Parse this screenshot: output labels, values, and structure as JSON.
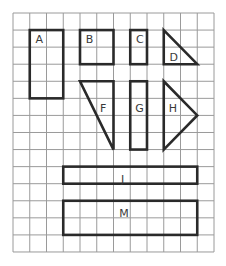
{
  "diagram": {
    "type": "grid-shapes",
    "grid": {
      "origin_x": 13,
      "origin_y": 13,
      "cell_w": 16.75,
      "cell_h": 17.07,
      "cols": 12,
      "rows": 14,
      "line_color": "#9a9a9a",
      "shape_color": "#2a2a2a"
    },
    "shapes": [
      {
        "label": "A",
        "kind": "rect",
        "col": 1,
        "row": 1,
        "w": 2,
        "h": 4,
        "label_pos": [
          0.35,
          0.55
        ]
      },
      {
        "label": "B",
        "kind": "rect",
        "col": 4,
        "row": 1,
        "w": 2,
        "h": 2,
        "label_pos": [
          0.35,
          0.55
        ]
      },
      {
        "label": "C",
        "kind": "rect",
        "col": 7,
        "row": 1,
        "w": 1,
        "h": 2,
        "label_pos": [
          0.35,
          0.55
        ]
      },
      {
        "label": "D",
        "kind": "triangle",
        "points": [
          [
            9,
            1
          ],
          [
            9,
            3
          ],
          [
            11,
            3
          ]
        ],
        "label_pos": [
          9.35,
          2.55
        ]
      },
      {
        "label": "F",
        "kind": "triangle",
        "points": [
          [
            4,
            4
          ],
          [
            6,
            4
          ],
          [
            6,
            8
          ]
        ],
        "label_pos": [
          5.2,
          5.55
        ]
      },
      {
        "label": "G",
        "kind": "rect",
        "col": 7,
        "row": 4,
        "w": 1,
        "h": 4,
        "label_pos": [
          0.3,
          1.55
        ]
      },
      {
        "label": "H",
        "kind": "triangle",
        "points": [
          [
            9,
            4
          ],
          [
            11,
            6
          ],
          [
            9,
            8
          ]
        ],
        "label_pos": [
          9.3,
          5.55
        ]
      },
      {
        "label": "J",
        "kind": "rect",
        "col": 3,
        "row": 9,
        "w": 8,
        "h": 1,
        "label_pos": [
          3.45,
          0.7
        ]
      },
      {
        "label": "M",
        "kind": "rect",
        "col": 3,
        "row": 11,
        "w": 8,
        "h": 2,
        "label_pos": [
          3.35,
          0.7
        ]
      }
    ]
  }
}
